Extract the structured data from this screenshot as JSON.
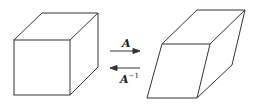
{
  "diagram": {
    "left_shape": "cube",
    "right_shape": "parallelepiped",
    "forward_label": "A",
    "inverse_label_base": "A",
    "inverse_label_sup": "−1",
    "line_color": "#333333"
  }
}
